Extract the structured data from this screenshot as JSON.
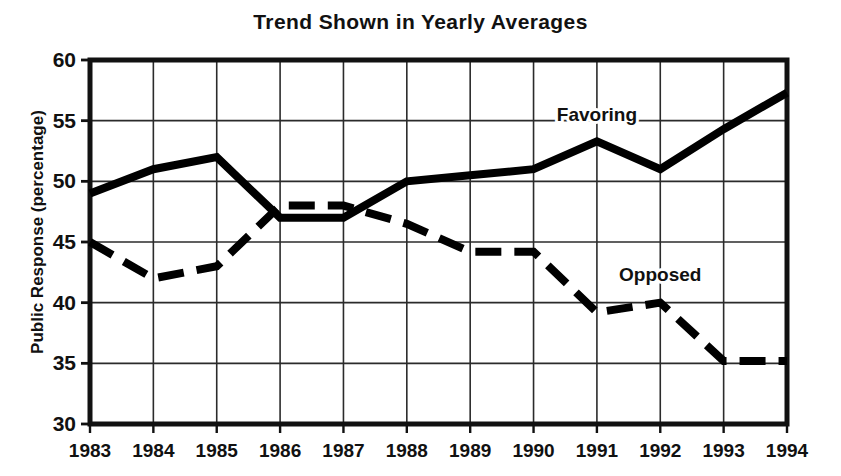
{
  "chart_data": {
    "type": "line",
    "title": "Trend Shown in Yearly Averages",
    "xlabel": "",
    "ylabel": "Public Response (percentage)",
    "categories": [
      "1983",
      "1984",
      "1985",
      "1986",
      "1987",
      "1988",
      "1989",
      "1990",
      "1991",
      "1992",
      "1993",
      "1994"
    ],
    "x": [
      1983,
      1984,
      1985,
      1986,
      1987,
      1988,
      1989,
      1990,
      1991,
      1992,
      1993,
      1994
    ],
    "ylim": [
      30,
      60
    ],
    "yticks": [
      30,
      35,
      40,
      45,
      50,
      55,
      60
    ],
    "ytick_labels": [
      "30",
      "35",
      "40",
      "45",
      "50",
      "55",
      "60"
    ],
    "grid": true,
    "grid_axis": "both",
    "legend_position": "inline-annotations",
    "series": [
      {
        "name": "Favoring",
        "style": "solid",
        "color": "#000000",
        "values": [
          49.0,
          51.0,
          52.0,
          47.0,
          47.0,
          50.0,
          50.5,
          51.0,
          53.3,
          51.0,
          54.3,
          57.3
        ],
        "annotation": "Favoring",
        "annotation_at_year": 1991,
        "annotation_at_value": 55.0
      },
      {
        "name": "Opposed",
        "style": "dashed",
        "color": "#000000",
        "values": [
          45.0,
          42.0,
          43.0,
          48.0,
          48.0,
          46.5,
          44.2,
          44.2,
          39.2,
          40.0,
          35.2,
          35.2
        ],
        "annotation": "Opposed",
        "annotation_at_year": 1992,
        "annotation_at_value": 41.8
      }
    ]
  },
  "axes": {
    "y_axis_title": "Public Response (percentage)",
    "y_min_label": "30",
    "y_max_label": "60"
  },
  "annotations": {
    "favoring_label": "Favoring",
    "opposed_label": "Opposed"
  }
}
